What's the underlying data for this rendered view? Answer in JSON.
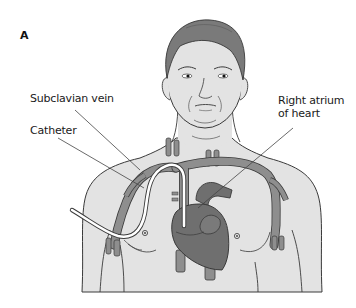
{
  "figure": {
    "panel_letter": "A",
    "labels": {
      "subclavian_vein": "Subclavian vein",
      "catheter": "Catheter",
      "right_atrium_line1": "Right atrium",
      "right_atrium_line2": "of heart"
    }
  },
  "colors": {
    "background": "#ffffff",
    "skin": "#e3e3e3",
    "hair": "#7a7a7a",
    "vessel": "#8e8e8e",
    "heart": "#6f6f6f",
    "outline": "#3a3a3a",
    "catheter": "#ffffff",
    "leader_line": "#444444"
  }
}
